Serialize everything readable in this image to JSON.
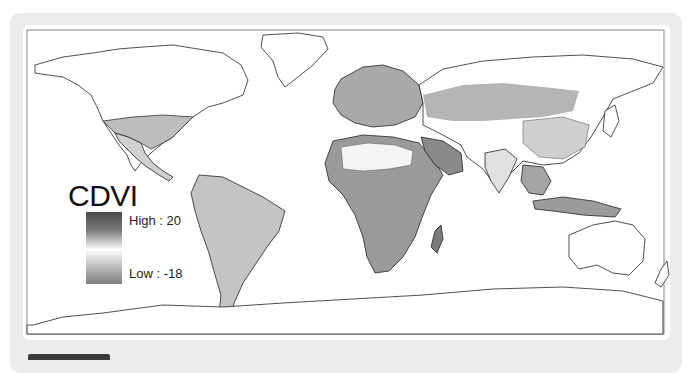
{
  "figure": {
    "legend": {
      "title": "CDVI",
      "high_label": "High : 20",
      "low_label": "Low : -18",
      "high_value": 20,
      "low_value": -18,
      "colors": {
        "high": "#4a4a4a",
        "mid": "#ffffff",
        "low": "#7e7e7e"
      }
    },
    "map": {
      "projection": "equirectangular world",
      "style": "grayscale choropleth with country borders"
    }
  },
  "colors": {
    "panel_bg": "#ececec",
    "card_bg": "#ffffff",
    "outline": "#222222",
    "tab": "#3a3a3a"
  }
}
